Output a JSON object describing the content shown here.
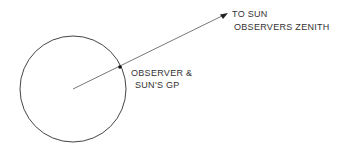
{
  "diagram": {
    "labels": {
      "to_sun": "TO SUN",
      "zenith": "OBSERVERS ZENITH",
      "observer": "OBSERVER &",
      "suns_gp": "SUN'S GP"
    },
    "colors": {
      "stroke": "#444444",
      "text": "#333333",
      "background": "#ffffff"
    }
  }
}
